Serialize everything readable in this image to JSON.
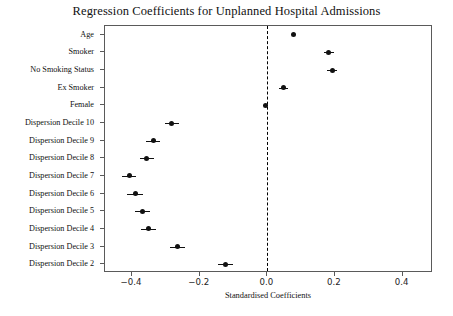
{
  "chart_data": {
    "type": "scatter",
    "title": "Regression Coefficients for Unplanned Hospital Admissions",
    "xlabel": "Standardised Coefficients",
    "ylabel": "",
    "xlim": [
      -0.48,
      0.49
    ],
    "xticks": [
      -0.4,
      -0.2,
      0.0,
      0.2,
      0.4
    ],
    "xtick_labels": [
      "−0.4",
      "−0.2",
      "0.0",
      "0.2",
      "0.4"
    ],
    "grid": false,
    "legend": null,
    "reference_line": {
      "x": 0.0,
      "style": "dashed",
      "color": "#000000"
    },
    "orientation": "horizontal",
    "marker_color": "#111111",
    "categories": [
      "Age",
      "Smoker",
      "No Smoking Status",
      "Ex Smoker",
      "Female",
      "Dispersion Decile 10",
      "Dispersion Decile 9",
      "Dispersion Decile 8",
      "Dispersion Decile 7",
      "Dispersion Decile 6",
      "Dispersion Decile 5",
      "Dispersion Decile 4",
      "Dispersion Decile 3",
      "Dispersion Decile 2"
    ],
    "values": [
      0.077,
      0.182,
      0.192,
      0.047,
      -0.006,
      -0.282,
      -0.338,
      -0.356,
      -0.409,
      -0.391,
      -0.37,
      -0.352,
      -0.265,
      -0.124
    ],
    "ci_low": [
      0.072,
      0.167,
      0.178,
      0.034,
      -0.014,
      -0.302,
      -0.359,
      -0.377,
      -0.429,
      -0.414,
      -0.392,
      -0.375,
      -0.287,
      -0.146
    ],
    "ci_high": [
      0.082,
      0.197,
      0.206,
      0.06,
      0.002,
      -0.262,
      -0.317,
      -0.335,
      -0.389,
      -0.368,
      -0.348,
      -0.329,
      -0.243,
      -0.102
    ]
  }
}
